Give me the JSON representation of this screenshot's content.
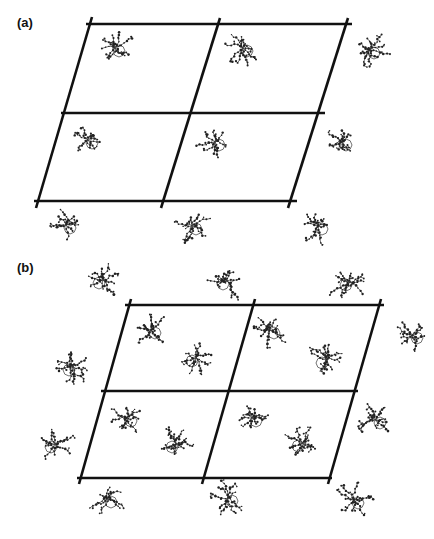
{
  "figure": {
    "panels": [
      {
        "id": "a",
        "label": "(a)",
        "lattice": {
          "cells_wide": 2,
          "cells_high": 2
        },
        "molecule_count": 9,
        "molecules_per_cell": 1
      },
      {
        "id": "b",
        "label": "(b)",
        "lattice": {
          "cells_wide": 2,
          "cells_high": 2
        },
        "molecule_count": 15,
        "molecules_per_cell": 2
      }
    ],
    "colors": {
      "line": "#111111",
      "molecule": "#333333",
      "background": "#ffffff"
    }
  }
}
